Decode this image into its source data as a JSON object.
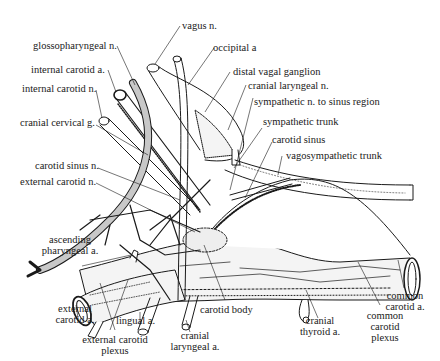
{
  "diagram": {
    "type": "anatomical illustration",
    "labels": {
      "vagus_n": "vagus n.",
      "glossopharyngeal_n": "glossopharyngeal n.",
      "occipital_a": "occipital a",
      "internal_carotid_a": "internal carotid a.",
      "distal_vagal_ganglion": "distal vagal ganglion",
      "internal_carotid_n": "internal carotid n.",
      "cranial_laryngeal_n": "cranial laryngeal n.",
      "sympathetic_n_to_sinus_region": "sympathetic n. to sinus region",
      "cranial_cervical_g": "cranial  cervical g.",
      "sympathetic_trunk": "sympathetic trunk",
      "carotid_sinus": "carotid sinus",
      "carotid_sinus_n": "carotid sinus n.",
      "vagosympathetic_trunk": "vagosympathetic trunk",
      "external_carotid_n": "external carotid n.",
      "ascending_pharyngeal_a_1": "ascending",
      "ascending_pharyngeal_a_2": "pharyngeal a.",
      "external_carotid_a_1": "external",
      "external_carotid_a_2": "carotid a.",
      "lingual_a": "lingual a.",
      "external_carotid_plexus_1": "external carotid",
      "external_carotid_plexus_2": "plexus",
      "carotid_body": "carotid body",
      "cranial_laryngeal_a_1": "cranial",
      "cranial_laryngeal_a_2": "laryngeal a.",
      "cranial_thyroid_a_1": "cranial",
      "cranial_thyroid_a_2": "thyroid a.",
      "common_carotid_plexus_1": "common",
      "common_carotid_plexus_2": "carotid",
      "common_carotid_plexus_3": "plexus",
      "common_carotid_a_1": "common",
      "common_carotid_a_2": "carotid a."
    },
    "colors": {
      "ink": "#1a1a1a",
      "background": "#ffffff",
      "glossopharyngeal_fill": "#c8c8c8",
      "vessel_fill": "#f4f4f4"
    }
  }
}
